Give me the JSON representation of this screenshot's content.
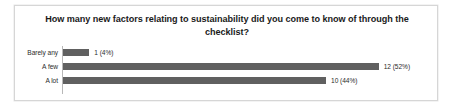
{
  "chart_data": {
    "type": "bar",
    "orientation": "horizontal",
    "title": "How many new factors relating to sustainability did you come to know of through the checklist?",
    "categories": [
      "Barely any",
      "A few",
      "A lot"
    ],
    "values": [
      1,
      12,
      10
    ],
    "percents": [
      "4%",
      "52%",
      "44%"
    ],
    "data_labels": [
      "1 (4%)",
      "12 (52%)",
      "10 (44%)"
    ],
    "xlabel": "",
    "ylabel": "",
    "xlim": [
      0,
      13
    ],
    "grid": false,
    "legend": false,
    "bar_color": "#606060",
    "axis_color": "#b8b8b8",
    "background": "#ffffff",
    "border_color": "#d6d6d6",
    "title_color": "#1a1a1a",
    "label_color": "#2b2b2b"
  }
}
